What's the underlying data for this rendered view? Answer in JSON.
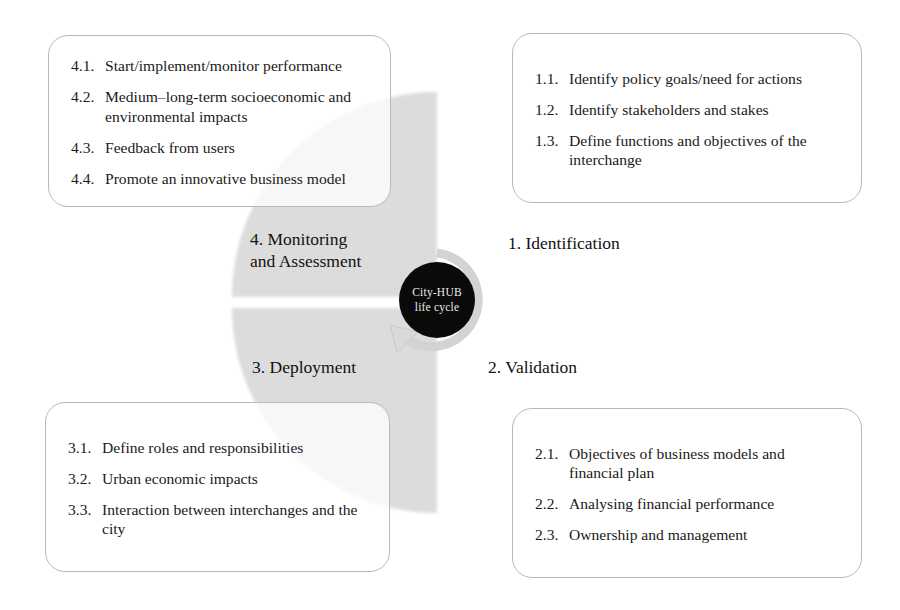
{
  "diagram": {
    "title": "City-HUB life cycle",
    "hub": {
      "line1": "City-HUB",
      "line2": "life cycle",
      "bg_color": "#0a0a0a",
      "text_color": "#e9e9e9"
    },
    "colors": {
      "wedge_grey": "#dcdcdc",
      "arrow_grey": "#d2d2d2",
      "card_border": "#b9b9b9",
      "text": "#1a1a1a",
      "background": "#ffffff"
    },
    "stages": [
      {
        "id": "identification",
        "label": "1. Identification",
        "position": "top-right",
        "items": [
          {
            "num": "1.1.",
            "text": "Identify policy goals/need for actions"
          },
          {
            "num": "1.2.",
            "text": "Identify stakeholders and stakes"
          },
          {
            "num": "1.3.",
            "text": "Define functions and objectives of the interchange"
          }
        ]
      },
      {
        "id": "validation",
        "label": "2. Validation",
        "position": "bottom-right",
        "items": [
          {
            "num": "2.1.",
            "text": "Objectives of business models and financial plan"
          },
          {
            "num": "2.2.",
            "text": "Analysing financial performance"
          },
          {
            "num": "2.3.",
            "text": "Ownership and management"
          }
        ]
      },
      {
        "id": "deployment",
        "label": "3. Deployment",
        "position": "bottom-left",
        "items": [
          {
            "num": "3.1.",
            "text": "Define roles and responsibilities"
          },
          {
            "num": "3.2.",
            "text": "Urban economic impacts"
          },
          {
            "num": "3.3.",
            "text": "Interaction between interchanges and the city"
          }
        ]
      },
      {
        "id": "monitoring-and-assessment",
        "label": "4. Monitoring\nand Assessment",
        "position": "top-left",
        "items": [
          {
            "num": "4.1.",
            "text": "Start/implement/monitor performance"
          },
          {
            "num": "4.2.",
            "text": "Medium–long-term socioeconomic and environmental impacts"
          },
          {
            "num": "4.3.",
            "text": "Feedback from users"
          },
          {
            "num": "4.4.",
            "text": "Promote an innovative business model"
          }
        ]
      }
    ]
  }
}
